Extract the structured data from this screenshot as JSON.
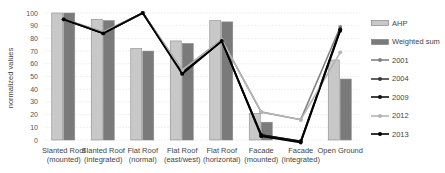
{
  "chart_data": {
    "type": "bar",
    "title": "",
    "xlabel": "",
    "ylabel": "normalized values",
    "ylim": [
      0,
      100
    ],
    "yticks": [
      0,
      10,
      20,
      30,
      40,
      50,
      60,
      70,
      80,
      90,
      100
    ],
    "grid": true,
    "legend_position": "right",
    "categories": [
      [
        "Slanted Roof",
        "(mounted)"
      ],
      [
        "Slanted Roof",
        "(integrated)"
      ],
      [
        "Flat Roof",
        "(normal)"
      ],
      [
        "Flat Roof",
        "(east/west)"
      ],
      [
        "Flat Roof",
        "(horizontal)"
      ],
      [
        "Facade",
        "(mounted)"
      ],
      [
        "Facade",
        "(integrated)"
      ],
      [
        "Open Ground",
        ""
      ]
    ],
    "bar_series": [
      {
        "name": "AHP",
        "color": "#c8c8c8",
        "values": [
          100,
          95,
          72,
          78,
          94,
          21,
          0,
          63
        ]
      },
      {
        "name": "Weighted sum",
        "color": "#7a7a7a",
        "values": [
          100,
          94,
          70,
          76,
          93,
          14,
          0,
          48
        ]
      }
    ],
    "line_series": [
      {
        "name": "2001",
        "color": "#808080",
        "width": 1.6,
        "values": [
          95,
          85,
          100,
          55,
          79,
          22,
          16,
          89
        ]
      },
      {
        "name": "2004",
        "color": "#3a3a3a",
        "width": 1.6,
        "values": [
          95,
          84,
          100,
          53,
          78,
          4,
          -1,
          87
        ]
      },
      {
        "name": "2009",
        "color": "#111111",
        "width": 1.8,
        "values": [
          95,
          84,
          100,
          53,
          78,
          4,
          -1,
          87
        ]
      },
      {
        "name": "2012",
        "color": "#b4b4b4",
        "width": 1.6,
        "values": [
          95,
          85,
          100,
          55,
          79,
          22,
          16,
          69
        ]
      },
      {
        "name": "2013",
        "color": "#000000",
        "width": 1.8,
        "values": [
          95,
          84,
          100,
          52,
          78,
          3,
          -2,
          86
        ]
      }
    ]
  },
  "legend": [
    {
      "label": "AHP",
      "kind": "bar",
      "color": "#c8c8c8"
    },
    {
      "label": "Weighted sum",
      "kind": "bar",
      "color": "#7a7a7a"
    },
    {
      "label": "2001",
      "kind": "line",
      "color": "#808080"
    },
    {
      "label": "2004",
      "kind": "line",
      "color": "#3a3a3a"
    },
    {
      "label": "2009",
      "kind": "line",
      "color": "#111111"
    },
    {
      "label": "2012",
      "kind": "line",
      "color": "#b4b4b4"
    },
    {
      "label": "2013",
      "kind": "line",
      "color": "#000000"
    }
  ]
}
